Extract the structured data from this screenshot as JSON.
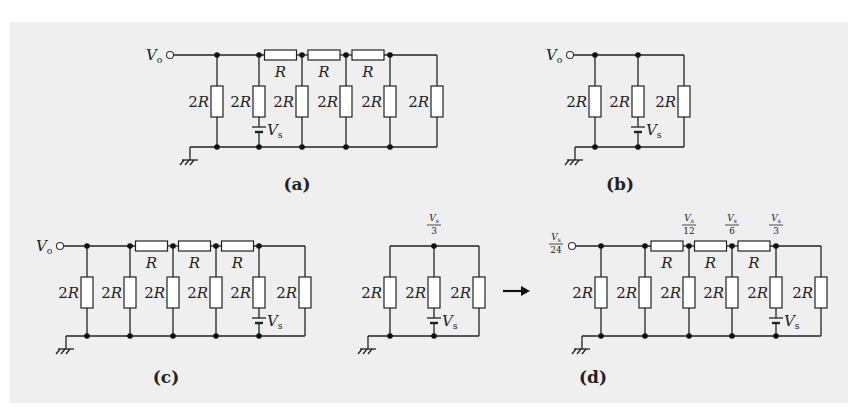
{
  "figure": {
    "panels": [
      {
        "id": "a",
        "caption": "(a)",
        "caption_pos": [
          297,
          190
        ],
        "output_label": "V",
        "output_sub": "o",
        "output_value": null,
        "terminal": [
          170,
          55
        ],
        "top_y": 55,
        "bottom_y": 147,
        "ground_x": 190,
        "shunts": [
          {
            "x": 217,
            "label": "2R",
            "source": false,
            "node_top": true,
            "node_bottom": true
          },
          {
            "x": 259,
            "label": "2R",
            "source": true,
            "node_top": true,
            "node_bottom": true
          },
          {
            "x": 302,
            "label": "2R",
            "source": false,
            "node_top": true,
            "node_bottom": true
          },
          {
            "x": 346,
            "label": "2R",
            "source": false,
            "node_top": true,
            "node_bottom": true
          },
          {
            "x": 390,
            "label": "2R",
            "source": false,
            "node_top": true,
            "node_bottom": true
          },
          {
            "x": 437,
            "label": "2R",
            "source": false,
            "node_top": false,
            "node_bottom": false
          }
        ],
        "series": [
          {
            "from": 259,
            "to": 302,
            "label": "R",
            "node_value": null
          },
          {
            "from": 302,
            "to": 346,
            "label": "R",
            "node_value": null
          },
          {
            "from": 346,
            "to": 390,
            "label": "R",
            "node_value": null
          }
        ],
        "top_node_value": null
      },
      {
        "id": "b",
        "caption": "(b)",
        "caption_pos": [
          620,
          190
        ],
        "output_label": "V",
        "output_sub": "o",
        "output_value": null,
        "terminal": [
          570,
          55
        ],
        "top_y": 55,
        "bottom_y": 147,
        "ground_x": 575,
        "shunts": [
          {
            "x": 595,
            "label": "2R",
            "source": false,
            "node_top": true,
            "node_bottom": true
          },
          {
            "x": 638,
            "label": "2R",
            "source": true,
            "node_top": true,
            "node_bottom": true
          },
          {
            "x": 684,
            "label": "2R",
            "source": false,
            "node_top": false,
            "node_bottom": false
          }
        ],
        "series": [],
        "top_node_value": null
      },
      {
        "id": "c",
        "caption": "(c)",
        "caption_pos": [
          166,
          383
        ],
        "output_label": "V",
        "output_sub": "o",
        "output_value": null,
        "terminal": [
          60,
          246
        ],
        "top_y": 246,
        "bottom_y": 336,
        "ground_x": 66,
        "shunts": [
          {
            "x": 87,
            "label": "2R",
            "source": false,
            "node_top": true,
            "node_bottom": true
          },
          {
            "x": 130,
            "label": "2R",
            "source": false,
            "node_top": true,
            "node_bottom": true
          },
          {
            "x": 173,
            "label": "2R",
            "source": false,
            "node_top": true,
            "node_bottom": true
          },
          {
            "x": 216,
            "label": "2R",
            "source": false,
            "node_top": true,
            "node_bottom": true
          },
          {
            "x": 259,
            "label": "2R",
            "source": true,
            "node_top": true,
            "node_bottom": true
          },
          {
            "x": 305,
            "label": "2R",
            "source": false,
            "node_top": false,
            "node_bottom": false
          }
        ],
        "series": [
          {
            "from": 130,
            "to": 173,
            "label": "R",
            "node_value": null
          },
          {
            "from": 173,
            "to": 216,
            "label": "R",
            "node_value": null
          },
          {
            "from": 216,
            "to": 259,
            "label": "R",
            "node_value": null
          }
        ],
        "top_node_value": null
      },
      {
        "id": "c-reduced",
        "caption": "",
        "caption_pos": null,
        "output_label": null,
        "output_sub": null,
        "output_value": null,
        "terminal": null,
        "top_y": 246,
        "bottom_y": 336,
        "ground_x": 368,
        "shunts": [
          {
            "x": 390,
            "label": "2R",
            "source": false,
            "node_top": false,
            "node_bottom": true
          },
          {
            "x": 434,
            "label": "2R",
            "source": true,
            "node_top": true,
            "node_bottom": true
          },
          {
            "x": 479,
            "label": "2R",
            "source": false,
            "node_top": false,
            "node_bottom": false
          }
        ],
        "series": [],
        "top_node_value": {
          "x": 434,
          "num": "V",
          "num_sub": "s",
          "den": "3"
        }
      },
      {
        "id": "d",
        "caption": "(d)",
        "caption_pos": [
          593,
          383
        ],
        "output_label": null,
        "output_sub": null,
        "output_value": {
          "num": "V",
          "num_sub": "s",
          "den": "24"
        },
        "terminal": [
          572,
          246
        ],
        "top_y": 246,
        "bottom_y": 336,
        "ground_x": 582,
        "shunts": [
          {
            "x": 601,
            "label": "2R",
            "source": false,
            "node_top": true,
            "node_bottom": true
          },
          {
            "x": 645,
            "label": "2R",
            "source": false,
            "node_top": true,
            "node_bottom": true
          },
          {
            "x": 689,
            "label": "2R",
            "source": false,
            "node_top": true,
            "node_bottom": true
          },
          {
            "x": 732,
            "label": "2R",
            "source": false,
            "node_top": true,
            "node_bottom": true
          },
          {
            "x": 776,
            "label": "2R",
            "source": true,
            "node_top": true,
            "node_bottom": true
          },
          {
            "x": 821,
            "label": "2R",
            "source": false,
            "node_top": false,
            "node_bottom": false
          }
        ],
        "series": [
          {
            "from": 645,
            "to": 689,
            "label": "R",
            "node_value": {
              "num": "V",
              "num_sub": "s",
              "den": "12"
            }
          },
          {
            "from": 689,
            "to": 732,
            "label": "R",
            "node_value": {
              "num": "V",
              "num_sub": "s",
              "den": "6"
            }
          },
          {
            "from": 732,
            "to": 776,
            "label": "R",
            "node_value": {
              "num": "V",
              "num_sub": "s",
              "den": "3"
            }
          }
        ],
        "top_node_value": null
      }
    ],
    "source_label": "V",
    "source_sub": "s",
    "arrow": {
      "from": [
        503,
        291
      ],
      "to": [
        530,
        291
      ],
      "symbol": "→"
    },
    "colors": {
      "panel_bg": "#efefef",
      "line": "#222222",
      "resistor_fill": "#ffffff"
    }
  }
}
